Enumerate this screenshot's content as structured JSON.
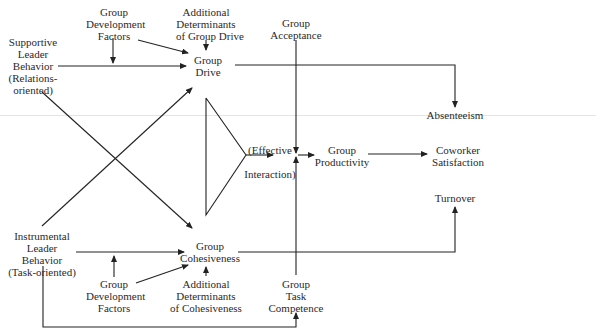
{
  "diagram": {
    "type": "causal path model",
    "nodes": {
      "supportive_leader": {
        "lines": [
          "Supportive",
          "Leader",
          "Behavior",
          "(Relations-",
          "oriented)"
        ]
      },
      "group_dev_top": {
        "lines": [
          "Group",
          "Development",
          "Factors"
        ]
      },
      "additional_drive": {
        "lines": [
          "Additional",
          "Determinants",
          "of Group Drive"
        ]
      },
      "group_drive": {
        "lines": [
          "Group",
          "Drive"
        ]
      },
      "group_acceptance": {
        "lines": [
          "Group",
          "Acceptance"
        ]
      },
      "absenteeism": {
        "lines": [
          "Absenteeism"
        ]
      },
      "effective_interaction": {
        "lines": [
          "(Effective",
          "Interaction)"
        ]
      },
      "group_productivity": {
        "lines": [
          "Group",
          "Productivity"
        ]
      },
      "coworker_satisfaction": {
        "lines": [
          "Coworker",
          "Satisfaction"
        ]
      },
      "turnover": {
        "lines": [
          "Turnover"
        ]
      },
      "instrumental_leader": {
        "lines": [
          "Instrumental",
          "Leader",
          "Behavior",
          "(Task-oriented)"
        ]
      },
      "group_cohesiveness": {
        "lines": [
          "Group",
          "Cohesiveness"
        ]
      },
      "group_dev_bottom": {
        "lines": [
          "Group",
          "Development",
          "Factors"
        ]
      },
      "additional_cohesiveness": {
        "lines": [
          "Additional",
          "Determinants",
          "of Cohesiveness"
        ]
      },
      "group_task_competence": {
        "lines": [
          "Group",
          "Task",
          "Competence"
        ]
      }
    },
    "edges": [
      {
        "from": "supportive_leader",
        "to": "group_drive"
      },
      {
        "from": "group_dev_top",
        "to": "supportive_leader->group_drive"
      },
      {
        "from": "additional_drive",
        "to": "group_drive"
      },
      {
        "from": "group_dev_top",
        "to": "group_drive"
      },
      {
        "from": "supportive_leader",
        "to": "group_cohesiveness"
      },
      {
        "from": "instrumental_leader",
        "to": "group_drive"
      },
      {
        "from": "instrumental_leader",
        "to": "group_cohesiveness"
      },
      {
        "from": "group_dev_bottom",
        "to": "instrumental_leader->group_cohesiveness"
      },
      {
        "from": "group_dev_bottom",
        "to": "group_cohesiveness"
      },
      {
        "from": "additional_cohesiveness",
        "to": "group_cohesiveness"
      },
      {
        "from": "group_drive",
        "to": "absenteeism"
      },
      {
        "from": "group_drive+group_cohesiveness",
        "to": "effective_interaction"
      },
      {
        "from": "effective_interaction",
        "to": "group_productivity"
      },
      {
        "from": "group_acceptance",
        "to": "group_productivity"
      },
      {
        "from": "group_task_competence",
        "to": "group_productivity"
      },
      {
        "from": "group_productivity",
        "to": "coworker_satisfaction"
      },
      {
        "from": "group_cohesiveness",
        "to": "turnover"
      },
      {
        "from": "instrumental_leader",
        "to": "group_task_competence"
      }
    ]
  }
}
